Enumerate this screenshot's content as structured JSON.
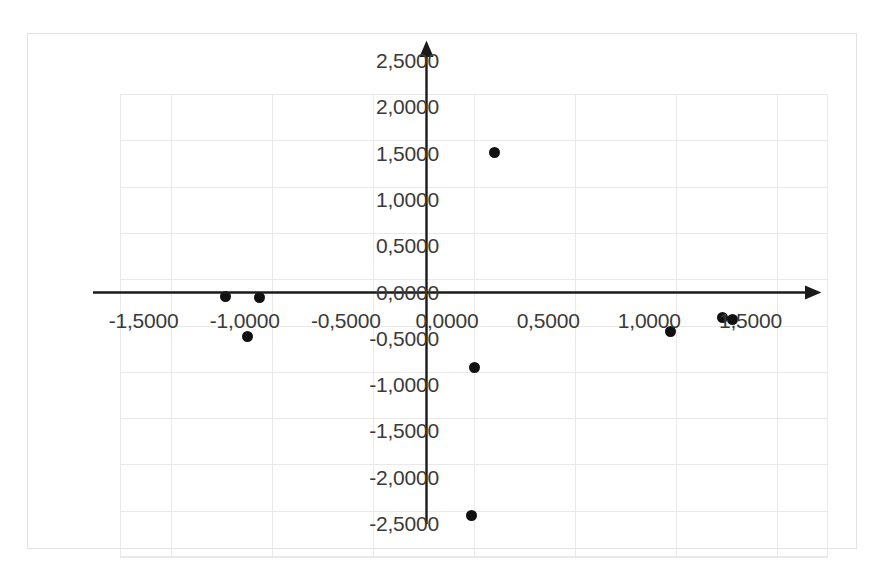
{
  "chart_data": {
    "type": "scatter",
    "title": "",
    "subtitle": "",
    "xlabel": "",
    "ylabel": "",
    "xlim": [
      -1.75,
      1.75
    ],
    "ylim": [
      -2.5,
      2.5
    ],
    "grid": true,
    "legend": false,
    "legend_position": "none",
    "decimal_separator": ",",
    "axes_cross_at_origin": true,
    "axis_arrowheads": true,
    "marker_color": "#111111",
    "marker_shape": "circle",
    "xticks": [
      -1.5,
      -1.0,
      -0.5,
      0.0,
      0.5,
      1.0,
      1.5
    ],
    "xticklabels": [
      "-1,5000",
      "-1,0000",
      "-0,5000",
      "0,0000",
      "0,5000",
      "1,0000",
      "1,5000"
    ],
    "yticks": [
      2.5,
      2.0,
      1.5,
      1.0,
      0.5,
      0.0,
      -0.5,
      -1.0,
      -1.5,
      -2.0,
      -2.5
    ],
    "yticklabels": [
      "2,5000",
      "2,0000",
      "1,5000",
      "1,0000",
      "0,5000",
      "0,0000",
      "-0,5000",
      "-1,0000",
      "-1,5000",
      "-2,0000",
      "-2,5000"
    ],
    "points": [
      {
        "x": -1.23,
        "y": 0.31
      },
      {
        "x": -1.06,
        "y": 0.3
      },
      {
        "x": -1.12,
        "y": -0.12
      },
      {
        "x": 0.1,
        "y": 1.87
      },
      {
        "x": 0.0,
        "y": -0.45
      },
      {
        "x": -0.01,
        "y": -2.05
      },
      {
        "x": 0.97,
        "y": -0.06
      },
      {
        "x": 1.23,
        "y": 0.09
      },
      {
        "x": 1.28,
        "y": 0.06
      }
    ],
    "series": [
      {
        "name": "Series 1",
        "x": [
          -1.23,
          -1.06,
          -1.12,
          0.1,
          0.0,
          -0.01,
          0.97,
          1.23,
          1.28
        ],
        "values": [
          0.31,
          0.3,
          -0.12,
          1.87,
          -0.45,
          -2.05,
          -0.06,
          0.09,
          0.06
        ]
      }
    ]
  },
  "colors": {
    "marker": "#111111",
    "axis": "#1a1a1a",
    "grid": "#e9e9e9",
    "frame": "#e3e3e3",
    "tick_text": "#3a3a3a"
  }
}
